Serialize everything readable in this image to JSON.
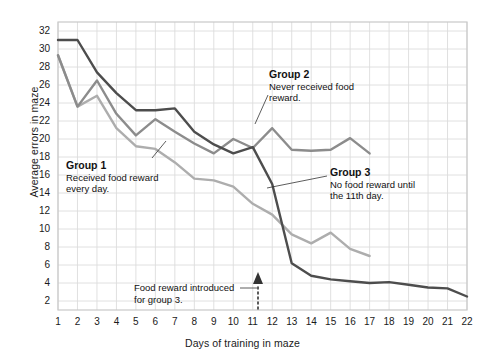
{
  "chart_data": {
    "type": "line",
    "title": "",
    "xlabel": "Days of training in maze",
    "ylabel": "Average errors in maze",
    "xlim": [
      1,
      22
    ],
    "ylim": [
      1,
      33
    ],
    "yticks": [
      2,
      4,
      6,
      8,
      10,
      12,
      14,
      16,
      18,
      20,
      22,
      24,
      26,
      28,
      30,
      32
    ],
    "xticks": [
      1,
      2,
      3,
      4,
      5,
      6,
      7,
      8,
      9,
      10,
      11,
      12,
      13,
      14,
      15,
      16,
      17,
      18,
      19,
      20,
      21,
      22
    ],
    "grid": true,
    "legend_position": "inline-annotations",
    "series": [
      {
        "name": "Group 1",
        "color": "#4d4d4d",
        "x": [
          1,
          2,
          3,
          4,
          5,
          6,
          7,
          8,
          9,
          10,
          11,
          12,
          13,
          14,
          15,
          16,
          17,
          18,
          19,
          20,
          21,
          22
        ],
        "values": [
          31,
          31,
          27.4,
          25.1,
          23.2,
          23.2,
          23.4,
          20.8,
          19.4,
          18.4,
          19.1,
          15.0,
          6.2,
          4.8,
          4.4,
          4.2,
          4.0,
          4.1,
          3.8,
          3.5,
          3.4,
          2.5
        ]
      },
      {
        "name": "Group 2",
        "color": "#8c8c8c",
        "x": [
          1,
          2,
          3,
          4,
          5,
          6,
          7,
          8,
          9,
          10,
          11,
          12,
          13,
          14,
          15,
          16,
          17
        ],
        "values": [
          29.3,
          23.6,
          26.5,
          22.8,
          20.4,
          22.2,
          20.8,
          19.5,
          18.4,
          20.0,
          19.0,
          21.2,
          18.8,
          18.7,
          18.8,
          20.1,
          18.4
        ]
      },
      {
        "name": "Group 3",
        "color": "#adadad",
        "x": [
          1,
          2,
          3,
          4,
          5,
          6,
          7,
          8,
          9,
          10,
          11,
          12,
          13,
          14,
          15,
          16,
          17
        ],
        "values": [
          29.3,
          23.6,
          24.8,
          21.2,
          19.2,
          18.9,
          17.4,
          15.6,
          15.4,
          14.7,
          12.8,
          11.6,
          9.4,
          8.4,
          9.6,
          7.8,
          7.0
        ]
      }
    ],
    "annotations": [
      {
        "id": "group1",
        "title": "Group 1",
        "text": "Received food reward every day.",
        "line1": "Received food reward",
        "line2": "every day."
      },
      {
        "id": "group2",
        "title": "Group 2",
        "text": "Never received food reward.",
        "line1": "Never received food",
        "line2": "reward."
      },
      {
        "id": "group3",
        "title": "Group 3",
        "text": "No food reward until the 11th day.",
        "line1": "No food reward until",
        "line2": "the 11th day."
      },
      {
        "id": "food-reward",
        "title": "",
        "text": "Food reward introduced for group 3.",
        "line1": "Food reward introduced",
        "line2": "for group 3.",
        "points_to_day": 11
      }
    ]
  },
  "axis": {
    "ylabel": "Average errors in maze",
    "xlabel": "Days of training in maze"
  }
}
